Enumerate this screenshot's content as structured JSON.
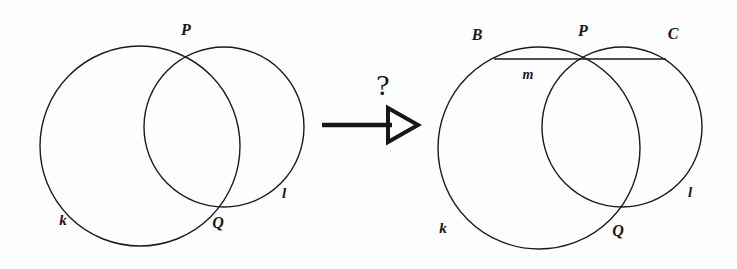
{
  "figure": {
    "background_color": "#fefefe",
    "stroke_color": "#1b1b1f",
    "panels": [
      {
        "name": "before",
        "labels": [
          {
            "id": "P",
            "text": "P",
            "x": 186,
            "y": 30,
            "kind": "point"
          },
          {
            "id": "Q",
            "text": "Q",
            "x": 218,
            "y": 223,
            "kind": "point"
          },
          {
            "id": "k",
            "text": "k",
            "x": 63,
            "y": 220,
            "kind": "curve"
          },
          {
            "id": "l",
            "text": "l",
            "x": 284,
            "y": 193,
            "kind": "curve"
          }
        ],
        "circles": [
          {
            "id": "k",
            "cx": 140,
            "cy": 146,
            "r": 100
          },
          {
            "id": "l",
            "cx": 224,
            "cy": 127,
            "r": 80
          }
        ],
        "lines": []
      },
      {
        "name": "after",
        "labels": [
          {
            "id": "B",
            "text": "B",
            "x": 477,
            "y": 35,
            "kind": "point"
          },
          {
            "id": "P",
            "text": "P",
            "x": 583,
            "y": 31,
            "kind": "point"
          },
          {
            "id": "C",
            "text": "C",
            "x": 673,
            "y": 34,
            "kind": "point"
          },
          {
            "id": "m",
            "text": "m",
            "x": 528,
            "y": 75,
            "kind": "line"
          },
          {
            "id": "k",
            "text": "k",
            "x": 443,
            "y": 228,
            "kind": "curve"
          },
          {
            "id": "Q",
            "text": "Q",
            "x": 618,
            "y": 231,
            "kind": "point"
          },
          {
            "id": "l",
            "text": "l",
            "x": 690,
            "y": 192,
            "kind": "curve"
          }
        ],
        "circles": [
          {
            "id": "k",
            "cx": 539,
            "cy": 148,
            "r": 101
          },
          {
            "id": "l",
            "cx": 622,
            "cy": 127,
            "r": 80
          }
        ],
        "lines": [
          {
            "id": "m",
            "x1": 494,
            "y1": 59,
            "x2": 666,
            "y2": 59
          }
        ]
      }
    ],
    "connector": {
      "name": "implication-arrow",
      "query_symbol": "?",
      "query_x": 383,
      "query_y": 85,
      "shaft_x1": 322,
      "shaft_x2": 403,
      "shaft_y": 125,
      "head_tip_x": 418,
      "head_back_x": 388,
      "head_half_height": 17
    }
  }
}
